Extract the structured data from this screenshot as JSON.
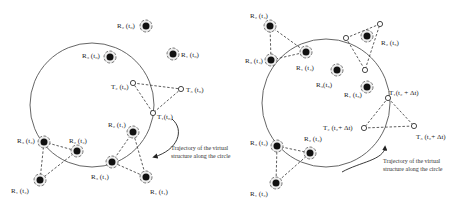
{
  "left_panel": {
    "robots": [
      {
        "label": "R₂ (t₀)",
        "x": 146,
        "y": 26,
        "lx": 117,
        "ly": 23
      },
      {
        "label": "R₃ (t₀)",
        "x": 110,
        "y": 57,
        "lx": 82,
        "ly": 53
      },
      {
        "label": "R₁ (t₀)",
        "x": 173,
        "y": 54,
        "lx": 181,
        "ly": 52
      },
      {
        "label": "R₂ (t₁)",
        "x": 133,
        "y": 132,
        "lx": 108,
        "ly": 122
      },
      {
        "label": "R₃ (t₁)",
        "x": 112,
        "y": 162,
        "lx": 91,
        "ly": 174
      },
      {
        "label": "R₁ (t₁)",
        "x": 146,
        "y": 177,
        "lx": 150,
        "ly": 189
      },
      {
        "label": "R₃ (t₂)",
        "x": 44,
        "y": 142,
        "lx": 17,
        "ly": 138
      },
      {
        "label": "R₂ (t₂)",
        "x": 77,
        "y": 151,
        "lx": 69,
        "ly": 138
      },
      {
        "label": "R₁ (t₂)",
        "x": 40,
        "y": 180,
        "lx": 11,
        "ly": 188
      }
    ],
    "targets": [
      {
        "label": "T₂ (t₀)",
        "x": 133,
        "y": 83,
        "lx": 111,
        "ly": 84
      },
      {
        "label": "T₃ (t₀)",
        "x": 181,
        "y": 89,
        "lx": 186,
        "ly": 87
      },
      {
        "label": "T₁(t₀)",
        "x": 153,
        "y": 113,
        "lx": 157,
        "ly": 114
      }
    ],
    "trajectory_note": "Trajectory of the virtual structure along the circle"
  },
  "right_panel": {
    "robots": [
      {
        "label": "R₂ (t₄)",
        "x": 270,
        "y": 26,
        "lx": 250,
        "ly": 13
      },
      {
        "label": "R₃ (t₄)",
        "x": 271,
        "y": 60,
        "lx": 245,
        "ly": 58
      },
      {
        "label": "R₁ (t₄)",
        "x": 306,
        "y": 52,
        "lx": 296,
        "ly": 65
      },
      {
        "label": "R₃(t₅)",
        "x": 337,
        "y": 70,
        "lx": 316,
        "ly": 82
      },
      {
        "label": "R₁ (t₅)",
        "x": 367,
        "y": 87,
        "lx": 344,
        "ly": 92
      },
      {
        "label": "R₂ (t₅)",
        "x": 367,
        "y": 36,
        "lx": 381,
        "ly": 40
      }
    ],
    "formation_points": [
      {
        "x": 346,
        "y": 38
      },
      {
        "x": 380,
        "y": 24
      },
      {
        "x": 365,
        "y": 70
      }
    ],
    "targets": [
      {
        "label": "T₁(t₂ + Δt)",
        "x": 388,
        "y": 98,
        "lx": 389,
        "ly": 90
      },
      {
        "label": "T₂ (t₂+ Δt)",
        "x": 364,
        "y": 128,
        "lx": 323,
        "ly": 125
      },
      {
        "label": "T₃ (t₂+ Δt)",
        "x": 414,
        "y": 126,
        "lx": 416,
        "ly": 134
      }
    ],
    "robots_t2": [
      {
        "label": "R₃ (t₂)",
        "x": 277,
        "y": 146,
        "lx": 250,
        "ly": 140
      },
      {
        "label": "R₂ (t₂)",
        "x": 310,
        "y": 153,
        "lx": 304,
        "ly": 136
      },
      {
        "label": "R₁ (t₂)",
        "x": 276,
        "y": 183,
        "lx": 250,
        "ly": 191
      }
    ],
    "trajectory_note": "Trajectory of the virtual structure along the circle"
  }
}
